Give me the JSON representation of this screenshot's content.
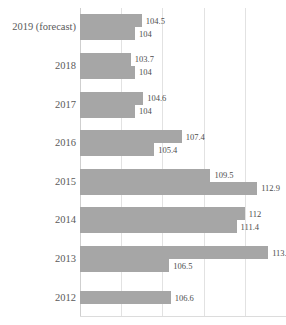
{
  "chart_data": {
    "type": "bar",
    "orientation": "horizontal",
    "title": "",
    "subtitle": "",
    "xlabel": "",
    "ylabel": "",
    "grid": true,
    "legend": "none",
    "xlim": [
      100,
      115
    ],
    "gridline_values": [
      100,
      103,
      106,
      109,
      112,
      115
    ],
    "categories": [
      "2019 (forecast)",
      "2018",
      "2017",
      "2016",
      "2015",
      "2014",
      "2013",
      "2012"
    ],
    "series": [
      {
        "name": "series-1",
        "values": [
          104.5,
          103.7,
          104.6,
          107.4,
          109.5,
          112,
          113.7,
          106.6
        ]
      },
      {
        "name": "series-2",
        "values": [
          104,
          104,
          104,
          105.4,
          112.9,
          111.4,
          106.5,
          null
        ]
      }
    ],
    "value_labels": [
      [
        "104.5",
        "104"
      ],
      [
        "103.7",
        "104"
      ],
      [
        "104.6",
        "104"
      ],
      [
        "107.4",
        "105.4"
      ],
      [
        "109.5",
        "112.9"
      ],
      [
        "112",
        "111.4"
      ],
      [
        "113.7",
        "106.5"
      ],
      [
        "106.6",
        null
      ]
    ],
    "colors": {
      "bar": "#a6a6a6",
      "gridline": "#e2e2e2",
      "axis": "#cfcfcf",
      "label_text": "#5a5a5a",
      "value_text": "#4d4d4d",
      "background": "#ffffff"
    }
  }
}
